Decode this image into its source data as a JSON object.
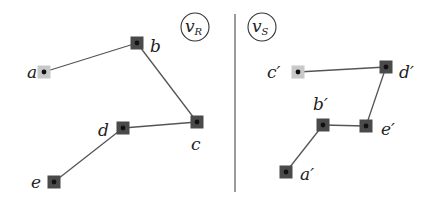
{
  "colors": {
    "node_dark": "#4a4a4a",
    "node_light": "#c8c8c8",
    "dot": "#111111",
    "edge": "#555555",
    "divider": "#666666"
  },
  "panels": [
    {
      "id": "vR",
      "badge": {
        "main": "v",
        "sub": "R",
        "cx": 195,
        "cy": 27
      },
      "nodes": [
        {
          "id": "a",
          "label": "a",
          "x": 44,
          "y": 72,
          "style": "light",
          "lx": 27,
          "ly": 78
        },
        {
          "id": "b",
          "label": "b",
          "x": 137,
          "y": 43,
          "style": "dark",
          "lx": 150,
          "ly": 52
        },
        {
          "id": "c",
          "label": "c",
          "x": 197,
          "y": 122,
          "style": "dark",
          "lx": 191,
          "ly": 150
        },
        {
          "id": "d",
          "label": "d",
          "x": 123,
          "y": 128,
          "style": "dark",
          "lx": 98,
          "ly": 136
        },
        {
          "id": "e",
          "label": "e",
          "x": 54,
          "y": 182,
          "style": "dark",
          "lx": 31,
          "ly": 188
        }
      ],
      "edges": [
        [
          "a",
          "b"
        ],
        [
          "b",
          "c"
        ],
        [
          "c",
          "d"
        ],
        [
          "d",
          "e"
        ]
      ]
    },
    {
      "id": "vS",
      "badge": {
        "main": "v",
        "sub": "S",
        "cx": 262,
        "cy": 27
      },
      "nodes": [
        {
          "id": "c'",
          "label": "c′",
          "x": 298,
          "y": 72,
          "style": "light",
          "lx": 267,
          "ly": 78
        },
        {
          "id": "d'",
          "label": "d′",
          "x": 386,
          "y": 67,
          "style": "dark",
          "lx": 399,
          "ly": 78
        },
        {
          "id": "b'",
          "label": "b′",
          "x": 323,
          "y": 125,
          "style": "dark",
          "lx": 313,
          "ly": 110
        },
        {
          "id": "e'",
          "label": "e′",
          "x": 366,
          "y": 126,
          "style": "dark",
          "lx": 381,
          "ly": 135
        },
        {
          "id": "a'",
          "label": "a′",
          "x": 286,
          "y": 172,
          "style": "dark",
          "lx": 300,
          "ly": 180
        }
      ],
      "edges": [
        [
          "c'",
          "d'"
        ],
        [
          "d'",
          "e'"
        ],
        [
          "e'",
          "b'"
        ],
        [
          "b'",
          "a'"
        ]
      ]
    }
  ],
  "divider": {
    "x": 235,
    "y1": 14,
    "y2": 192
  }
}
